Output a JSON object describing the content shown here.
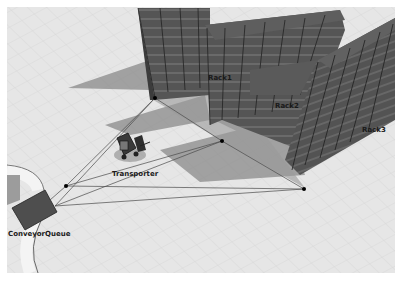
{
  "view": {
    "type": "3D model view",
    "background_color": "#e4e4e4",
    "rack_color": "#4a4a4a",
    "node_color": "#000000"
  },
  "objects": [
    {
      "id": "rack1",
      "label": "Rack1",
      "kind": "rack"
    },
    {
      "id": "rack2",
      "label": "Rack2",
      "kind": "rack"
    },
    {
      "id": "rack3",
      "label": "Rack3",
      "kind": "rack"
    },
    {
      "id": "transporter",
      "label": "Transporter",
      "kind": "forklift"
    },
    {
      "id": "conveyor_queue",
      "label": "ConveyorQueue",
      "kind": "queue"
    }
  ],
  "network_nodes": [
    {
      "id": "node-rack1"
    },
    {
      "id": "node-rack2"
    },
    {
      "id": "node-rack3"
    },
    {
      "id": "node-queue"
    }
  ]
}
